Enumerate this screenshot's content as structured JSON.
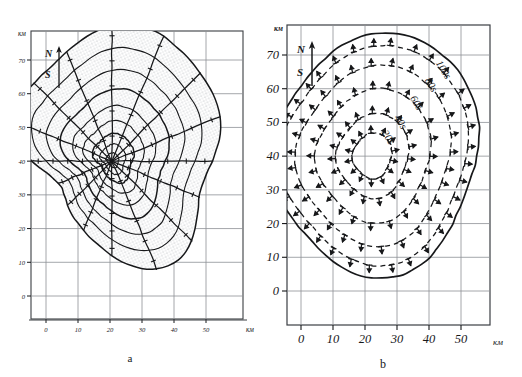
{
  "figure": {
    "background_color": "#ffffff",
    "ink_color": "#17181a",
    "grid_color": "#8d9096",
    "stipple_color": "#9aa0a6",
    "panels": [
      "a",
      "b"
    ]
  },
  "panel_a": {
    "caption": "a",
    "axis_unit_y": "км",
    "axis_unit_x": "км",
    "y_ticks": [
      "70",
      "60",
      "50",
      "40",
      "30",
      "20",
      "10",
      "0"
    ],
    "x_ticks": [
      "0",
      "10",
      "20",
      "30",
      "40",
      "50"
    ],
    "compass": {
      "north": "N",
      "south": "S"
    },
    "description": "polar radial mesh with stippled shading"
  },
  "panel_b": {
    "caption": "b",
    "axis_unit_y": "км",
    "axis_unit_x": "км",
    "y_ticks": [
      "70",
      "60",
      "50",
      "40",
      "30",
      "20",
      "10",
      "0"
    ],
    "x_ticks": [
      "0",
      "10",
      "20",
      "30",
      "40",
      "50"
    ],
    "compass": {
      "north": "N",
      "south": "S"
    },
    "contour_labels": [
      "20s",
      "40s",
      "60s",
      "80s",
      "100s"
    ]
  },
  "chart_data": {
    "type": "line",
    "title": "",
    "xlabel": "км",
    "ylabel": "км",
    "xlim": [
      -5,
      57
    ],
    "ylim": [
      -8,
      75
    ],
    "grid": true,
    "legend": "none",
    "panels": [
      {
        "id": "a",
        "caption": "a",
        "type": "polar-mesh",
        "origin_km": [
          20,
          40
        ],
        "ray_count": 16,
        "arc_radii_km": [
          2,
          4,
          6.5,
          9.5,
          13,
          17,
          21.5,
          26.5,
          32
        ],
        "ray_angles_deg": [
          0,
          22.5,
          45,
          67.5,
          90,
          112.5,
          135,
          157.5,
          180,
          202.5,
          225,
          247.5,
          270,
          292.5,
          315,
          337.5
        ],
        "annotation": "stippled (hatched) fill over wavefront mesh"
      },
      {
        "id": "b",
        "caption": "b",
        "type": "contour",
        "origin_km": [
          22,
          40
        ],
        "contours": [
          {
            "label": "20s",
            "level": 20,
            "style": "dashed",
            "mean_radius_km": 6.5
          },
          {
            "label": "40s",
            "level": 40,
            "style": "dashed",
            "mean_radius_km": 12.0
          },
          {
            "label": "60s",
            "level": 60,
            "style": "dashed",
            "mean_radius_km": 19.0
          },
          {
            "label": "80s",
            "level": 80,
            "style": "dashed",
            "mean_radius_km": 25.5
          },
          {
            "label": "100s",
            "level": 100,
            "style": "dashed",
            "mean_radius_km": 31.0
          },
          {
            "label": "",
            "level": 120,
            "style": "solid",
            "mean_radius_km": 34.5
          }
        ],
        "arrows": "radial outward barbs along each dashed contour"
      }
    ]
  }
}
